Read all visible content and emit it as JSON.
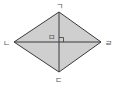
{
  "diagram": {
    "type": "rhombus",
    "fill_color": "#cfcfcf",
    "stroke_color": "#3a3a3a",
    "vertices": {
      "top": {
        "label": "ㄱ",
        "x": 59,
        "y": 12
      },
      "left": {
        "label": "ㄴ",
        "x": 14,
        "y": 42
      },
      "bottom": {
        "label": "ㄷ",
        "x": 59,
        "y": 72
      },
      "right": {
        "label": "ㄹ",
        "x": 101,
        "y": 42
      }
    },
    "center": {
      "label": "ㅁ",
      "x": 59,
      "y": 42
    },
    "right_angle_mark": true
  }
}
